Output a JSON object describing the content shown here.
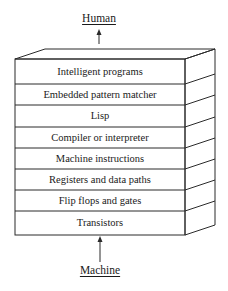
{
  "diagram": {
    "top_label": "Human",
    "bottom_label": "Machine",
    "layers": [
      {
        "label": "Intelligent programs"
      },
      {
        "label": "Embedded pattern matcher"
      },
      {
        "label": "Lisp"
      },
      {
        "label": "Compiler or interpreter"
      },
      {
        "label": "Machine instructions"
      },
      {
        "label": "Registers and data paths"
      },
      {
        "label": "Flip flops and gates"
      },
      {
        "label": "Transistors"
      }
    ],
    "arrow_direction": "up",
    "line_color": "#2a2a2a"
  }
}
